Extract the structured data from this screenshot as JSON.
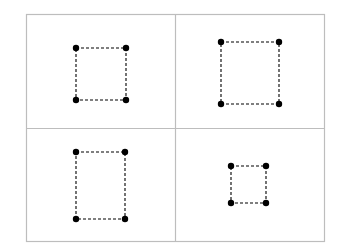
{
  "diagram": {
    "colors": {
      "background": "#ffffff",
      "panel_border": "#bdbdbd",
      "point": "#000000",
      "dash_line": "#000000"
    },
    "grid": {
      "left": 26,
      "top": 14,
      "right": 324,
      "bottom": 241,
      "mid_x": 175,
      "mid_y": 128
    },
    "point_radius": 3.2,
    "panels": [
      {
        "name": "panel-top-left",
        "points": [
          [
            76,
            48
          ],
          [
            126,
            48
          ],
          [
            126,
            100
          ],
          [
            76,
            100
          ]
        ]
      },
      {
        "name": "panel-top-right",
        "points": [
          [
            221,
            42
          ],
          [
            279,
            42
          ],
          [
            279,
            104
          ],
          [
            221,
            104
          ]
        ]
      },
      {
        "name": "panel-bottom-left",
        "points": [
          [
            76,
            152
          ],
          [
            125,
            152
          ],
          [
            125,
            219
          ],
          [
            76,
            219
          ]
        ]
      },
      {
        "name": "panel-bottom-right",
        "points": [
          [
            231,
            166
          ],
          [
            266,
            166
          ],
          [
            266,
            203
          ],
          [
            231,
            203
          ]
        ]
      }
    ]
  }
}
